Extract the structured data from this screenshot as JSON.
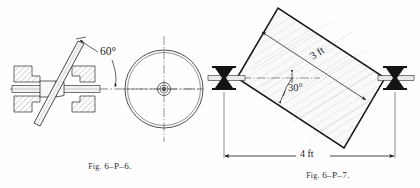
{
  "page": {
    "background_color": "#fefefe",
    "ink_color": "#1a1a1a",
    "hatch_color": "#8c8c8c"
  },
  "figures": [
    {
      "id": "fig-6-p-6",
      "caption_prefix": "Fig.",
      "caption_number": "6–P–6.",
      "caption_full": "Fig. 6–P–6.",
      "description": "Edge view of a disk mounted obliquely on a rotating shaft between two hatched bearing supports, shown alongside its circular face view.",
      "angle_label": "60°",
      "views": [
        {
          "name": "side-elevation",
          "elements": [
            "left-bearing-block",
            "right-bearing-block",
            "shaft",
            "hub-collar",
            "tilted-plate",
            "shaft-centerline"
          ]
        },
        {
          "name": "face-view",
          "elements": [
            "outer-rim-circle",
            "inner-rim-circle",
            "hub-outer-circle",
            "hub-inner-circle",
            "horizontal-centerline",
            "vertical-centerline"
          ]
        }
      ]
    },
    {
      "id": "fig-6-p-7",
      "caption_prefix": "Fig.",
      "caption_number": "6–P–7.",
      "caption_full": "Fig. 6–P–7.",
      "description": "Rectangular plate supported at two opposite corners on grooved roller bearings, inclined at 30 degrees, with a 3 ft diagonal dimension and a 4 ft span dimension.",
      "angle_label": "30°",
      "dimensions": [
        {
          "name": "diagonal-width",
          "label": "3 ft",
          "value": 3,
          "unit": "ft"
        },
        {
          "name": "support-span",
          "label": "4 ft",
          "value": 4,
          "unit": "ft"
        }
      ],
      "supports": [
        {
          "name": "left-roller-support",
          "type": "grooved-roller"
        },
        {
          "name": "right-roller-support",
          "type": "grooved-roller"
        }
      ]
    }
  ]
}
